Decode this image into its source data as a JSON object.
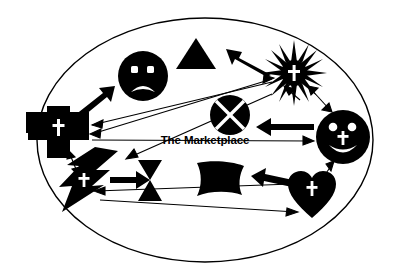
{
  "diagram": {
    "title": "The Marketplace",
    "center_label": "The Marketplace",
    "background_color": "#ffffff",
    "ink_color": "#000000",
    "boundary": {
      "shape": "ellipse",
      "name": "marketplace-boundary",
      "cx": 205,
      "cy": 140,
      "rx": 168,
      "ry": 122,
      "stroke_color": "#000000",
      "fill_color": "#ffffff"
    },
    "nodes": [
      {
        "id": "cross-plus",
        "icon": "plus-cross-icon",
        "label": "",
        "x": 58,
        "y": 128
      },
      {
        "id": "sad-face",
        "icon": "sad-face-icon",
        "label": "",
        "x": 143,
        "y": 75
      },
      {
        "id": "triangle",
        "icon": "triangle-icon",
        "label": "",
        "x": 196,
        "y": 55
      },
      {
        "id": "sunburst",
        "icon": "sunburst-cross-icon",
        "label": "",
        "x": 294,
        "y": 73
      },
      {
        "id": "x-circle",
        "icon": "x-circle-icon",
        "label": "",
        "x": 230,
        "y": 115
      },
      {
        "id": "smiley",
        "icon": "smiley-cross-icon",
        "label": "",
        "x": 343,
        "y": 137
      },
      {
        "id": "lightning",
        "icon": "lightning-cross-icon",
        "label": "",
        "x": 83,
        "y": 183
      },
      {
        "id": "hourglass",
        "icon": "hourglass-icon",
        "label": "",
        "x": 150,
        "y": 181
      },
      {
        "id": "scroll",
        "icon": "scroll-page-icon",
        "label": "",
        "x": 219,
        "y": 183
      },
      {
        "id": "heart",
        "icon": "heart-cross-icon",
        "label": "",
        "x": 312,
        "y": 193
      }
    ],
    "connections": [
      {
        "id": "cross-to-sadface",
        "from": "cross-plus",
        "to": "sad-face",
        "style": "thick",
        "heads": "single"
      },
      {
        "id": "sunburst-to-triangle",
        "from": "sunburst",
        "to": "triangle",
        "style": "thick",
        "heads": "single"
      },
      {
        "id": "smiley-to-xcircle",
        "from": "smiley",
        "to": "x-circle",
        "style": "thick",
        "heads": "single"
      },
      {
        "id": "lightning-to-hourglass",
        "from": "lightning",
        "to": "hourglass",
        "style": "thick",
        "heads": "single"
      },
      {
        "id": "heart-to-scroll",
        "from": "heart",
        "to": "scroll",
        "style": "thick",
        "heads": "single"
      },
      {
        "id": "sunburst-to-cross",
        "from": "sunburst",
        "to": "cross-plus",
        "style": "thin",
        "heads": "single"
      },
      {
        "id": "cross-to-sunburst",
        "from": "cross-plus",
        "to": "sunburst",
        "style": "thin",
        "heads": "single"
      },
      {
        "id": "xcircle-to-lightning",
        "from": "x-circle",
        "to": "lightning",
        "style": "thin",
        "heads": "single"
      },
      {
        "id": "cross-to-smiley",
        "from": "cross-plus",
        "to": "smiley",
        "style": "thin",
        "heads": "single"
      },
      {
        "id": "lightning-to-heart",
        "from": "lightning",
        "to": "heart",
        "style": "thin",
        "heads": "single"
      },
      {
        "id": "heart-to-lightning",
        "from": "heart",
        "to": "lightning",
        "style": "thin",
        "heads": "single"
      },
      {
        "id": "sunburst-smiley-pair",
        "from": "sunburst",
        "to": "smiley",
        "style": "thin",
        "heads": "double"
      },
      {
        "id": "cross-lightning-pair",
        "from": "cross-plus",
        "to": "lightning",
        "style": "thin",
        "heads": "double"
      },
      {
        "id": "smiley-heart-pair",
        "from": "smiley",
        "to": "heart",
        "style": "thin",
        "heads": "double"
      },
      {
        "id": "sunburst-lightning-thin",
        "from": "sunburst",
        "to": "lightning",
        "style": "thin",
        "heads": "single"
      }
    ]
  }
}
